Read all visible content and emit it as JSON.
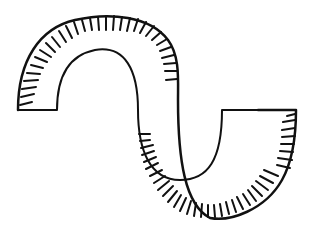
{
  "illustration": {
    "subject": "s-shaped-curved-band",
    "style": "hand-drawn line art",
    "stroke_color": "#111111",
    "background_color": "#ffffff"
  }
}
